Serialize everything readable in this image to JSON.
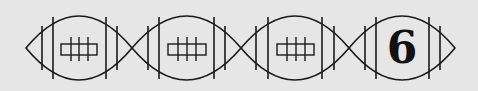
{
  "figure": {
    "type": "sequence-puzzle",
    "background_color": "#e6e6e6",
    "stroke_color": "#1a1a1a",
    "footballs": [
      {
        "index": 1,
        "content": "laces",
        "label": ""
      },
      {
        "index": 2,
        "content": "laces",
        "label": ""
      },
      {
        "index": 3,
        "content": "laces",
        "label": ""
      },
      {
        "index": 4,
        "content": "number",
        "label": "6"
      }
    ]
  }
}
